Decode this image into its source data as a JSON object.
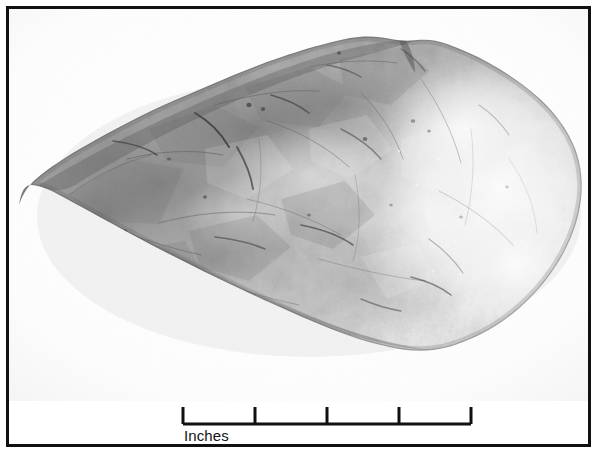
{
  "figure": {
    "kind": "archaeological-specimen-photograph",
    "background": "white seamless photographic backdrop",
    "color_mode": "grayscale",
    "frame": {
      "border_color": "#111111",
      "border_width_px": 3,
      "fill": "#ffffff"
    }
  },
  "scale_bar": {
    "label": "Inches",
    "unit": "Inches",
    "major_divisions": 4,
    "tick_count": 5,
    "tick_values": [
      "0",
      "1",
      "2",
      "3",
      "4"
    ],
    "bar_color": "#111111",
    "total_length_px": 288,
    "interval_px": 72
  },
  "specimen": {
    "outline_note": "teardrop / leaf shaped biface, pointed at left, broadly rounded at right",
    "tones": {
      "lightest": "#fbfbfb",
      "light": "#e2e2e2",
      "mid": "#b9b9b9",
      "mid_dark": "#9a9a9a",
      "dark": "#6f6f6f",
      "darkest": "#2b2b2b"
    }
  },
  "caption_sliver": {
    "text": "",
    "note": "bottom line of page text cropped off below the plate"
  }
}
